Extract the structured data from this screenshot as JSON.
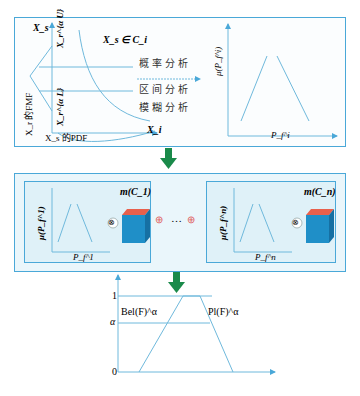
{
  "panel_top": {
    "left_plot": {
      "y_axis_label": "X_s",
      "set_label": "X_s ∈ C_i",
      "upper_label": "X_r^{α U}",
      "lower_label": "X_r^{α L}",
      "fmf_label": "X_r 的FMF",
      "pdf_label": "X_s 的PDF",
      "x_axis_label": "X_i",
      "methods": [
        "概率分析",
        "区间分析",
        "模糊分析"
      ]
    },
    "right_plot": {
      "y_axis_label": "μ(P_f^i)",
      "x_axis_label": "P_f^i"
    }
  },
  "panel_middle": {
    "left_box": {
      "mass_label": "m(C_1)",
      "y_axis_label": "μ(P_f^1)",
      "x_axis_label": "P_f^1"
    },
    "right_box": {
      "mass_label": "m(C_n)",
      "y_axis_label": "μ(P_f^n)",
      "x_axis_label": "P_f^n"
    },
    "otimes": "⊗",
    "oplus": "⊕",
    "ellipsis": "…"
  },
  "panel_bottom": {
    "tick_1": "1",
    "tick_alpha": "α",
    "tick_0": "0",
    "bel_label": "Bel(F)^α",
    "pl_label": "Pl(F)^α"
  },
  "colors": {
    "line": "#6fb9dc",
    "border": "#4aa8d8",
    "arrow": "#1a8a4a",
    "cube_top": "#e8604c",
    "cube_front": "#1f8fc8",
    "cube_side": "#1670a3"
  }
}
